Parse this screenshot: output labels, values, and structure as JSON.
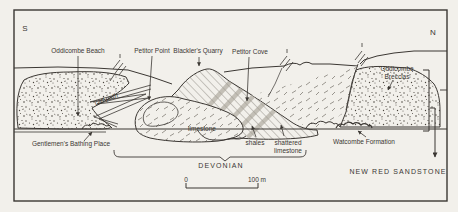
{
  "figure": {
    "type": "geological-cross-section",
    "orientation": {
      "left": "S",
      "right": "N"
    },
    "labels": {
      "south": "S",
      "north": "N",
      "oddicombe_beach": "Oddicombe Beach",
      "petitor_point": "Petitor Point",
      "blacklers_quarry": "Blackler's Quarry",
      "petitor_cove": "Petitor Cove",
      "oddicombe_breccias_line1": "Oddicombe",
      "oddicombe_breccias_line2": "Breccias",
      "cliff_path": "cliff path",
      "gentlemens_bathing_place": "Gentlemen's Bathing Place",
      "limestone": "limestone",
      "shales": "shales",
      "shattered_line1": "shattered",
      "shattered_line2": "limestone",
      "watcombe_formation": "Watcombe Formation",
      "devonian": "DEVONIAN",
      "new_red_sandstone": "NEW RED SANDSTONE"
    },
    "scale_bar": {
      "start_label": "0",
      "end_label": "100 m"
    },
    "colors": {
      "paper": "#f2f0eb",
      "ink": "#3b3733",
      "speck": "#4a453e",
      "dip_band": "#a39e93"
    }
  }
}
